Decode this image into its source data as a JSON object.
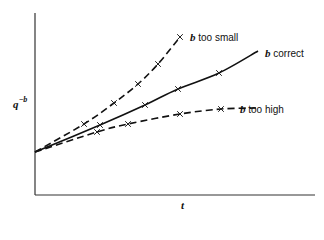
{
  "chart_data": {
    "type": "line",
    "title": "",
    "xlabel": "t",
    "ylabel": "q^-b",
    "ylabel_base": "q",
    "ylabel_exp": "−b",
    "grid": false,
    "ticks": "none",
    "legend_position": "inline labels at line ends",
    "origin": {
      "x": 0,
      "y": 0.25
    },
    "series": [
      {
        "name": "b too small",
        "label_b": "b",
        "label_rest": " too small",
        "line_style": "dashed",
        "marker": "x",
        "curvature": "concave up",
        "points_px": [
          [
            35,
            152
          ],
          [
            84,
            124
          ],
          [
            114,
            103
          ],
          [
            138,
            84
          ],
          [
            158,
            64
          ],
          [
            180,
            37
          ]
        ],
        "markers_px": [
          [
            84,
            124
          ],
          [
            114,
            103
          ],
          [
            138,
            84
          ],
          [
            158,
            64
          ],
          [
            180,
            37
          ]
        ]
      },
      {
        "name": "b correct",
        "label_b": "b",
        "label_rest": " correct",
        "line_style": "solid",
        "marker": "x",
        "curvature": "linear",
        "points_px": [
          [
            35,
            152
          ],
          [
            100,
            125
          ],
          [
            145,
            105
          ],
          [
            178,
            89
          ],
          [
            219,
            73
          ],
          [
            258,
            51
          ]
        ],
        "markers_px": [
          [
            100,
            125
          ],
          [
            145,
            105
          ],
          [
            178,
            89
          ],
          [
            219,
            73
          ]
        ]
      },
      {
        "name": "b too high",
        "label_b": "b",
        "label_rest": " too high",
        "line_style": "dashed",
        "marker": "x",
        "curvature": "concave down",
        "points_px": [
          [
            35,
            152
          ],
          [
            97,
            132
          ],
          [
            128,
            124
          ],
          [
            180,
            114
          ],
          [
            221,
            109
          ],
          [
            256,
            108
          ]
        ],
        "markers_px": [
          [
            97,
            132
          ],
          [
            128,
            124
          ],
          [
            180,
            114
          ],
          [
            221,
            109
          ]
        ]
      }
    ]
  },
  "axes": {
    "y_axis": {
      "x": 35,
      "top": 13,
      "bottom": 195
    },
    "x_axis": {
      "y": 195,
      "left": 35,
      "right": 315
    }
  }
}
